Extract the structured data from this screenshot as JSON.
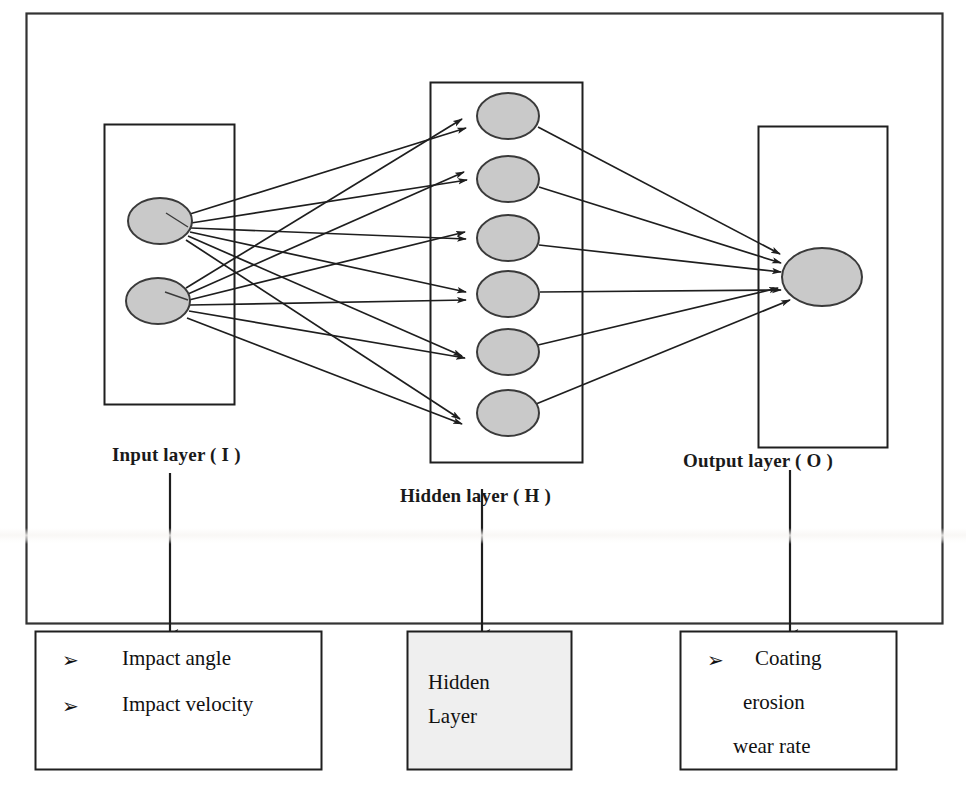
{
  "figure": {
    "type": "artificial-neural-network-architecture",
    "title_visible": false,
    "frame": {
      "x": 26,
      "y": 13,
      "width": 917,
      "height": 611
    }
  },
  "colors": {
    "node_fill": "#c9c9c9",
    "node_stroke": "#3a3a3a",
    "line": "#1e1e1e",
    "box_stroke": "#1f1f1f",
    "hidden_box_fill": "#efefef",
    "page_background": "#ffffff",
    "text": "#111111"
  },
  "network": {
    "input_layer": {
      "label": "Input layer ( I )",
      "label_pos": {
        "x": 112,
        "y": 445
      },
      "box": {
        "x": 104,
        "y": 124,
        "width": 131,
        "height": 281
      },
      "node_count": 2,
      "nodes": [
        {
          "cx": 160,
          "cy": 221,
          "rx": 32,
          "ry": 23
        },
        {
          "cx": 158,
          "cy": 301,
          "rx": 32,
          "ry": 23
        }
      ]
    },
    "hidden_layer": {
      "label": "Hidden layer ( H )",
      "label_pos": {
        "x": 400,
        "y": 486
      },
      "box": {
        "x": 430,
        "y": 82,
        "width": 153,
        "height": 381
      },
      "node_count": 6,
      "nodes": [
        {
          "cx": 508,
          "cy": 116,
          "rx": 31,
          "ry": 23
        },
        {
          "cx": 508,
          "cy": 179,
          "rx": 31,
          "ry": 23
        },
        {
          "cx": 508,
          "cy": 238,
          "rx": 31,
          "ry": 23
        },
        {
          "cx": 508,
          "cy": 294,
          "rx": 31,
          "ry": 23
        },
        {
          "cx": 508,
          "cy": 352,
          "rx": 31,
          "ry": 23
        },
        {
          "cx": 508,
          "cy": 413,
          "rx": 31,
          "ry": 23
        }
      ]
    },
    "output_layer": {
      "label": "Output layer ( O )",
      "label_pos": {
        "x": 683,
        "y": 451
      },
      "box": {
        "x": 758,
        "y": 126,
        "width": 130,
        "height": 322
      },
      "node_count": 1,
      "nodes": [
        {
          "cx": 822,
          "cy": 277,
          "rx": 40,
          "ry": 29
        }
      ]
    },
    "connections": {
      "input_to_hidden_count": 12,
      "hidden_to_output_count": 6,
      "style": "directed-arrow",
      "fully_connected": true
    }
  },
  "pointer_arrows": [
    {
      "name": "input-pointer",
      "x": 170,
      "y1": 473,
      "y2": 634
    },
    {
      "name": "hidden-pointer",
      "x": 482,
      "y1": 489,
      "y2": 634
    },
    {
      "name": "output-pointer",
      "x": 790,
      "y1": 470,
      "y2": 634
    }
  ],
  "bottom_boxes": [
    {
      "name": "input-variables-box",
      "box": {
        "x": 35,
        "y": 631,
        "width": 287,
        "height": 139
      },
      "filled": false,
      "items": [
        {
          "bullet": "arrowhead-bullet",
          "text": "Impact angle"
        },
        {
          "bullet": "arrowhead-bullet",
          "text": "Impact velocity"
        }
      ]
    },
    {
      "name": "hidden-layer-box",
      "box": {
        "x": 407,
        "y": 631,
        "width": 165,
        "height": 139
      },
      "filled": true,
      "lines": [
        "Hidden",
        "Layer"
      ]
    },
    {
      "name": "output-variable-box",
      "box": {
        "x": 680,
        "y": 631,
        "width": 217,
        "height": 139
      },
      "filled": false,
      "bullet": "arrowhead-bullet",
      "lines": [
        "Coating",
        "erosion",
        "wear rate"
      ]
    }
  ],
  "glyphs": {
    "arrowhead_bullet": "➢"
  }
}
